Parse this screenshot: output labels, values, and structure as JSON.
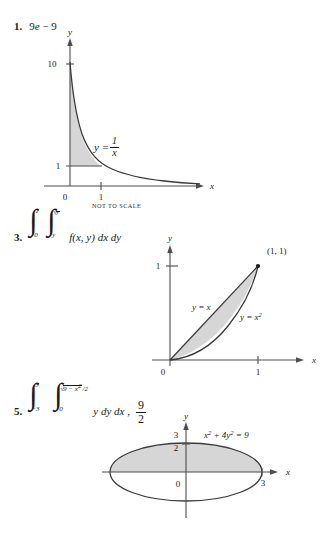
{
  "page": {
    "background": "#ffffff",
    "shade_color": "#d6d6d6",
    "axis_color": "#4d4d4d",
    "curve_color": "#3a3a3a"
  },
  "problems": [
    {
      "number": "1.",
      "answer": "9e − 9",
      "answer_parts": {
        "coef": "9",
        "e": "e",
        "minus": "−",
        "nine": "9"
      },
      "figure": {
        "kind": "hyperbola-region",
        "y_axis_label": "y",
        "x_axis_label": "x",
        "y_ticks": [
          "10",
          "1"
        ],
        "x_ticks": [
          "0",
          "1"
        ],
        "curve_label_lhs": "y =",
        "curve_label_num": "1",
        "curve_label_den": "x",
        "note": "NOT TO SCALE"
      }
    },
    {
      "number": "3.",
      "integral": {
        "outer_lower": "0",
        "outer_upper": "1",
        "inner_lower": "y",
        "inner_upper_radicand": "y",
        "inner_upper_prefix": "√",
        "integrand": "f(x, y) dx dy"
      },
      "figure": {
        "kind": "between-curves",
        "y_axis_label": "y",
        "x_axis_label": "x",
        "y_ticks": [
          "1"
        ],
        "x_ticks": [
          "1"
        ],
        "origin_label": "0",
        "point_label": "(1, 1)",
        "curve_label_line": "y = x",
        "curve_label_parabola_lhs": "y = x",
        "curve_label_parabola_exp": "2"
      }
    },
    {
      "number": "5.",
      "integral": {
        "outer_lower": "−3",
        "outer_upper": "3",
        "inner_lower": "0",
        "inner_upper_prefix": "√",
        "inner_upper_radicand": "9 − x",
        "inner_upper_exp": "2",
        "inner_upper_divisor": "/2",
        "integrand": "y dy dx ,"
      },
      "answer_frac": {
        "numerator": "9",
        "denominator": "2"
      },
      "figure": {
        "kind": "ellipse-upper-half",
        "y_axis_label": "y",
        "x_axis_label": "x",
        "y_ticks": [
          "3",
          "2"
        ],
        "x_ticks": [
          "3"
        ],
        "origin_label": "0",
        "equation_lhs": "x",
        "equation_exp1": "2",
        "equation_mid": " + 4y",
        "equation_exp2": "2",
        "equation_rhs": " = 9"
      }
    }
  ]
}
